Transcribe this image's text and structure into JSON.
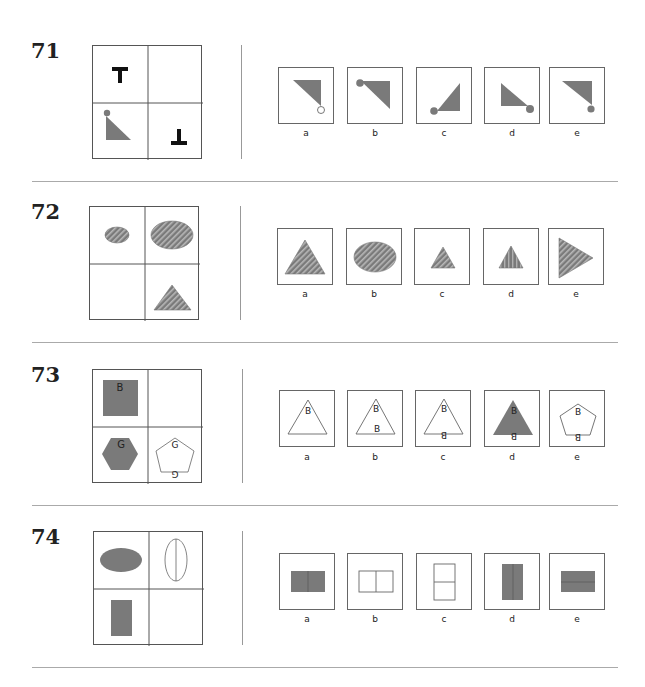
{
  "questions": [
    {
      "number": "71",
      "grid": {
        "top_left": "letter T upright",
        "top_right": "empty (missing)",
        "bottom_left": "gray right triangle with small gray circle at top vertex",
        "bottom_right": "letter T inverted"
      },
      "options": [
        {
          "label": "a",
          "description": "gray triangle, hollow circle at bottom-right vertex"
        },
        {
          "label": "b",
          "description": "gray triangle, gray circle at top-left vertex"
        },
        {
          "label": "c",
          "description": "gray triangle pointing up-right, gray circle at bottom-left"
        },
        {
          "label": "d",
          "description": "gray triangle, gray circle at bottom-right"
        },
        {
          "label": "e",
          "description": "gray triangle, gray circle at bottom-right vertex"
        }
      ]
    },
    {
      "number": "72",
      "grid": {
        "top_left": "small hatched ellipse",
        "top_right": "large hatched ellipse",
        "bottom_left": "empty (missing)",
        "bottom_right": "large hatched triangle"
      },
      "options": [
        {
          "label": "a",
          "description": "large hatched triangle"
        },
        {
          "label": "b",
          "description": "large hatched ellipse"
        },
        {
          "label": "c",
          "description": "small hatched triangle"
        },
        {
          "label": "d",
          "description": "small vertically striped triangle"
        },
        {
          "label": "e",
          "description": "hatched triangle pointing right"
        }
      ]
    },
    {
      "number": "73",
      "grid": {
        "top_left": "gray square with letter B",
        "top_right": "empty (missing)",
        "bottom_left": "gray hexagon with letter G",
        "bottom_right": "white pentagon with letter G and inverted G"
      },
      "top_left_letter": "B",
      "bottom_left_letter": "G",
      "bottom_right_letters": [
        "G",
        "G"
      ],
      "options": [
        {
          "label": "a",
          "description": "white triangle with B",
          "letters": [
            "B"
          ]
        },
        {
          "label": "b",
          "description": "white triangle with B and B",
          "letters": [
            "B",
            "B"
          ]
        },
        {
          "label": "c",
          "description": "white triangle with B and inverted B",
          "letters": [
            "B",
            "B"
          ]
        },
        {
          "label": "d",
          "description": "gray triangle with B and inverted B",
          "letters": [
            "B",
            "B"
          ]
        },
        {
          "label": "e",
          "description": "white pentagon with B and inverted B",
          "letters": [
            "B",
            "B"
          ]
        }
      ]
    },
    {
      "number": "74",
      "grid": {
        "top_left": "gray horizontal ellipse",
        "top_right": "white vertical ellipse with vertical line",
        "bottom_left": "gray vertical rectangle",
        "bottom_right": "empty (missing)"
      },
      "options": [
        {
          "label": "a",
          "description": "gray horizontal rectangle with vertical line"
        },
        {
          "label": "b",
          "description": "white horizontal rectangle with vertical line"
        },
        {
          "label": "c",
          "description": "white vertical rectangle with horizontal line"
        },
        {
          "label": "d",
          "description": "gray vertical rectangle with vertical line"
        },
        {
          "label": "e",
          "description": "gray horizontal rectangle with horizontal line"
        }
      ]
    }
  ],
  "colors": {
    "shape_fill": "#7a7a7a",
    "hatch_light": "#b8b8b8",
    "border": "#555555",
    "separator": "#aaaaaa"
  }
}
